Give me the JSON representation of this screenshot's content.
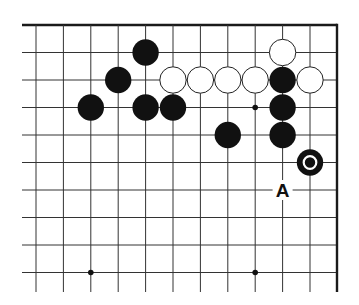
{
  "diagram": {
    "type": "go-board-fragment",
    "corner": "top-right",
    "visible_columns": 11,
    "visible_rows": 10,
    "colors": {
      "black": "#111111",
      "white": "#ffffff",
      "line": "#333333",
      "background": "#ffffff"
    },
    "stones": [
      {
        "color": "black",
        "col": 4,
        "row": 1
      },
      {
        "color": "black",
        "col": 3,
        "row": 2
      },
      {
        "color": "white",
        "col": 5,
        "row": 2
      },
      {
        "color": "white",
        "col": 6,
        "row": 2
      },
      {
        "color": "white",
        "col": 7,
        "row": 2
      },
      {
        "color": "white",
        "col": 8,
        "row": 2
      },
      {
        "color": "black",
        "col": 9,
        "row": 2
      },
      {
        "color": "white",
        "col": 10,
        "row": 2
      },
      {
        "color": "white",
        "col": 9,
        "row": 1
      },
      {
        "color": "black",
        "col": 2,
        "row": 3
      },
      {
        "color": "black",
        "col": 4,
        "row": 3
      },
      {
        "color": "black",
        "col": 5,
        "row": 3
      },
      {
        "color": "black",
        "col": 9,
        "row": 3
      },
      {
        "color": "black",
        "col": 7,
        "row": 4
      },
      {
        "color": "black",
        "col": 9,
        "row": 4
      },
      {
        "color": "black",
        "col": 10,
        "row": 5,
        "marked": true
      }
    ],
    "hoshi": [
      {
        "col": 8,
        "row": 3
      },
      {
        "col": 2,
        "row": 9
      },
      {
        "col": 8,
        "row": 9
      }
    ],
    "labels": [
      {
        "text": "A",
        "col": 9,
        "row": 6
      }
    ]
  }
}
